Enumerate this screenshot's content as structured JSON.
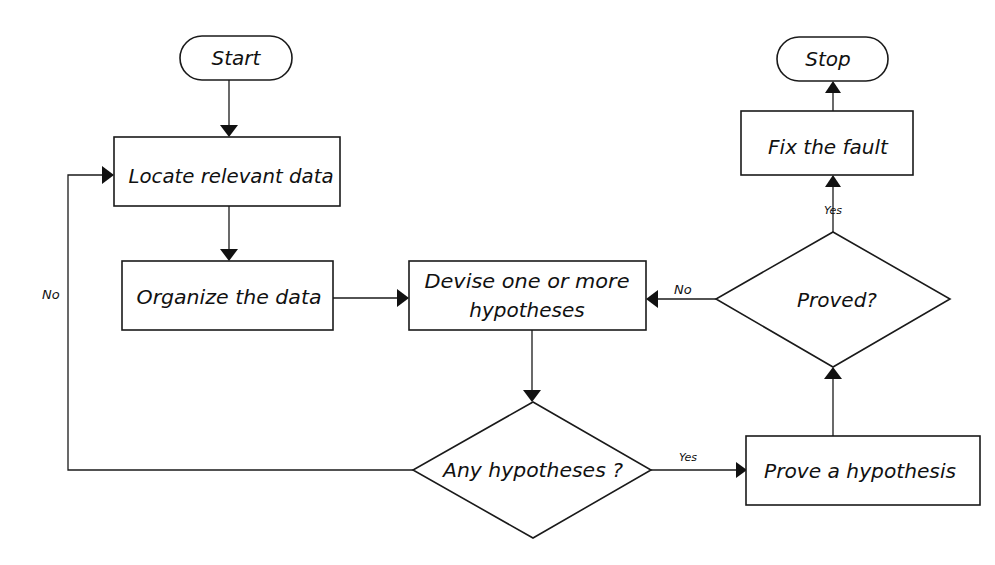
{
  "diagram": {
    "type": "flowchart",
    "nodes": {
      "start": {
        "shape": "terminator",
        "label": "Start"
      },
      "locate": {
        "shape": "process",
        "label": "Locate relevant data"
      },
      "organize": {
        "shape": "process",
        "label": "Organize the data"
      },
      "devise": {
        "shape": "process",
        "label_line1": "Devise one or more",
        "label_line2": "hypotheses"
      },
      "any": {
        "shape": "decision",
        "label": "Any hypotheses ?"
      },
      "prove": {
        "shape": "process",
        "label": "Prove a hypothesis"
      },
      "proved": {
        "shape": "decision",
        "label": "Proved?"
      },
      "fix": {
        "shape": "process",
        "label": "Fix the fault"
      },
      "stop": {
        "shape": "terminator",
        "label": "Stop"
      }
    },
    "edges": [
      {
        "from": "start",
        "to": "locate",
        "label": ""
      },
      {
        "from": "locate",
        "to": "organize",
        "label": ""
      },
      {
        "from": "organize",
        "to": "devise",
        "label": ""
      },
      {
        "from": "devise",
        "to": "any",
        "label": ""
      },
      {
        "from": "any",
        "to": "prove",
        "label": "Yes"
      },
      {
        "from": "any",
        "to": "locate",
        "label": "No"
      },
      {
        "from": "prove",
        "to": "proved",
        "label": ""
      },
      {
        "from": "proved",
        "to": "devise",
        "label": "No"
      },
      {
        "from": "proved",
        "to": "fix",
        "label": "Yes"
      },
      {
        "from": "fix",
        "to": "stop",
        "label": ""
      }
    ],
    "edge_labels": {
      "any_no": "No",
      "any_yes": "Yes",
      "proved_no": "No",
      "proved_yes": "Yes"
    }
  }
}
